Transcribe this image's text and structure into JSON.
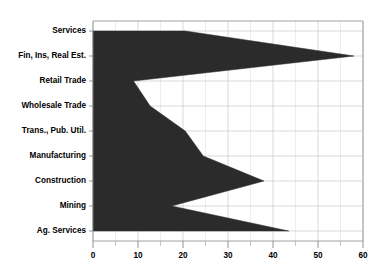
{
  "chart_data": {
    "type": "area",
    "orientation": "horizontal",
    "title": "",
    "subtitle": "",
    "xlabel": "",
    "ylabel": "",
    "categories": [
      "Services",
      "Fin, Ins, Real Est.",
      "Retail Trade",
      "Wholesale Trade",
      "Trans., Pub. Util.",
      "Manufacturing",
      "Construction",
      "Mining",
      "Ag. Services"
    ],
    "values": [
      20.5,
      58.0,
      9.0,
      12.7,
      20.5,
      24.5,
      38.0,
      17.5,
      43.5
    ],
    "series": [
      {
        "name": "value",
        "values": [
          20.5,
          58.0,
          9.0,
          12.7,
          20.5,
          24.5,
          38.0,
          17.5,
          43.5
        ]
      }
    ],
    "xlim": [
      0,
      60
    ],
    "xticks": [
      0,
      10,
      20,
      30,
      40,
      50,
      60
    ],
    "xtick_labels": [
      "0",
      "10",
      "20",
      "30",
      "40",
      "50",
      "60"
    ],
    "x_minor_tick_step": 5,
    "grid": true,
    "grid_axis": "both",
    "legend": false,
    "legend_position": "none",
    "fill_color": "#2b2b2b",
    "grid_color": "#c9c9c9",
    "axis_color": "#8a8a8a",
    "background_color": "#ffffff",
    "text_color": "#000000"
  },
  "plot_geometry": {
    "left_px": 93,
    "right_px": 363,
    "top_px": 21,
    "bottom_px": 241,
    "category_start_px": 31,
    "category_step_px": 25
  }
}
